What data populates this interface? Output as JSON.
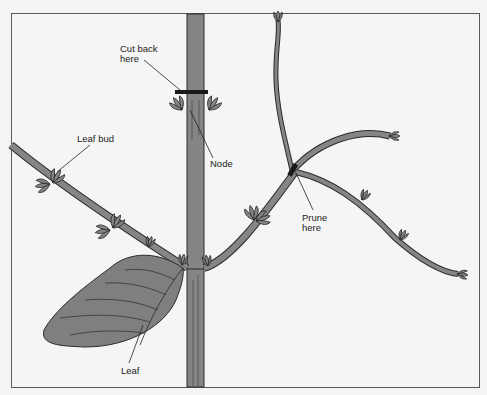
{
  "diagram": {
    "type": "plant pruning illustration",
    "colors": {
      "background": "#f5f5f5",
      "stem_fill": "#858585",
      "outline": "#2a2a2a",
      "leaf_fill": "#7f7f7f",
      "frame_border": "#5a5a5a"
    },
    "labels": {
      "cut_back": "Cut back\nhere",
      "node": "Node",
      "leaf_bud": "Leaf bud",
      "prune": "Prune\nhere",
      "leaf": "Leaf"
    }
  }
}
